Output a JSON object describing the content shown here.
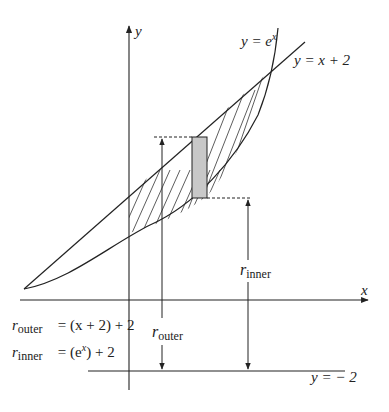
{
  "labels": {
    "y_axis": "y",
    "x_axis": "x",
    "curve_exp": {
      "lhs": "y = e",
      "sup": "x"
    },
    "curve_line": "y = x + 2",
    "line_neg2": "y =  − 2",
    "r_inner_label": {
      "r": "r",
      "sub": "inner"
    },
    "r_outer_label": {
      "r": "r",
      "sub": "outer"
    }
  },
  "equations": [
    {
      "r": "r",
      "sub": "outer",
      "rhs": "= (x + 2) + 2"
    },
    {
      "r": "r",
      "sub": "inner",
      "rhs_pre": "= (e",
      "sup": "x",
      "rhs_post": ") + 2"
    }
  ],
  "colors": {
    "stroke": "#222222",
    "rect_fill": "#c8c8c8",
    "hatch": "#333333"
  }
}
